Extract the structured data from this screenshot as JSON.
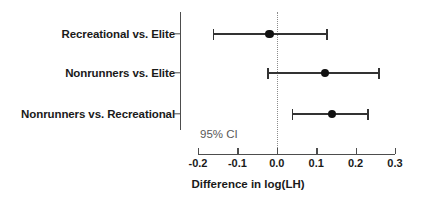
{
  "chart_data": {
    "type": "scatter",
    "title": "",
    "subtitle": "",
    "xlabel": "Difference in log(LH)",
    "ylabel": "",
    "xlim": [
      -0.2,
      0.3
    ],
    "xticks": [
      "-0.2",
      "-0.1",
      "0.0",
      "0.1",
      "0.2",
      "0.3"
    ],
    "xtick_values": [
      -0.2,
      -0.1,
      0.0,
      0.1,
      0.2,
      0.3
    ],
    "grid": false,
    "legend": null,
    "reference_line": {
      "value": 0.0,
      "style": "dotted",
      "color": "#8c8c8c"
    },
    "annotations": [
      {
        "text": "95% CI",
        "x": -0.195,
        "y_row": "below-last"
      }
    ],
    "categories": [
      "Recreational vs. Elite",
      "Nonrunners vs. Elite",
      "Nonrunners vs. Recreational"
    ],
    "points": [
      {
        "category": "Recreational vs. Elite",
        "estimate": -0.018,
        "ci_low": -0.163,
        "ci_high": 0.13
      },
      {
        "category": "Nonrunners vs. Elite",
        "estimate": 0.122,
        "ci_low": -0.025,
        "ci_high": 0.262
      },
      {
        "category": "Nonrunners vs. Recreational",
        "estimate": 0.14,
        "ci_low": 0.038,
        "ci_high": 0.234
      }
    ],
    "marker_color": "#111111",
    "line_color": "#333333",
    "axis_color": "#4d4d4d"
  }
}
